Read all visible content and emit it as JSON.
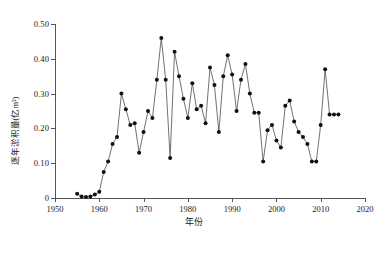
{
  "chart_data": {
    "type": "line",
    "title": "",
    "xlabel": "年份",
    "ylabel": "逐年淤积量(亿m³)",
    "xlim": [
      1950,
      2020
    ],
    "ylim": [
      0,
      0.5
    ],
    "xticks": [
      1950,
      1960,
      1970,
      1980,
      1990,
      2000,
      2010,
      2020
    ],
    "xtick_labels": [
      "1950",
      "1960",
      "1970",
      "1980",
      "1990",
      "2000",
      "2010",
      "2020"
    ],
    "yticks": [
      0,
      0.1,
      0.2,
      0.3,
      0.4,
      0.5
    ],
    "ytick_labels": [
      "0",
      "0.10",
      "0.20",
      "0.30",
      "0.40",
      "0.50"
    ],
    "grid": false,
    "legend": null,
    "marker": "filled-circle",
    "marker_color": "#111111",
    "line_color": "#4d4d4d",
    "x": [
      1955,
      1956,
      1957,
      1958,
      1959,
      1960,
      1961,
      1962,
      1963,
      1964,
      1965,
      1966,
      1967,
      1968,
      1969,
      1970,
      1971,
      1972,
      1973,
      1974,
      1975,
      1976,
      1977,
      1978,
      1979,
      1980,
      1981,
      1982,
      1983,
      1984,
      1985,
      1986,
      1987,
      1988,
      1989,
      1990,
      1991,
      1992,
      1993,
      1994,
      1995,
      1996,
      1997,
      1998,
      1999,
      2000,
      2001,
      2002,
      2003,
      2004,
      2005,
      2006,
      2007,
      2008,
      2009,
      2010,
      2011,
      2012,
      2013,
      2014
    ],
    "values": [
      0.012,
      0.004,
      0.003,
      0.004,
      0.01,
      0.018,
      0.075,
      0.105,
      0.155,
      0.175,
      0.3,
      0.255,
      0.21,
      0.215,
      0.13,
      0.19,
      0.25,
      0.23,
      0.34,
      0.46,
      0.34,
      0.115,
      0.42,
      0.35,
      0.285,
      0.23,
      0.33,
      0.255,
      0.265,
      0.215,
      0.375,
      0.325,
      0.19,
      0.35,
      0.41,
      0.355,
      0.25,
      0.34,
      0.385,
      0.3,
      0.245,
      0.245,
      0.105,
      0.195,
      0.21,
      0.165,
      0.145,
      0.265,
      0.28,
      0.22,
      0.19,
      0.175,
      0.155,
      0.105,
      0.105,
      0.21,
      0.37,
      0.24,
      0.24,
      0.24
    ]
  }
}
